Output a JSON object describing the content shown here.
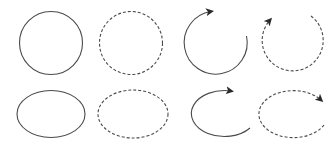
{
  "diagram": {
    "stroke_color": "#4a4a4a",
    "arrow_color": "#2a2a2a",
    "background": "#ffffff",
    "rows": [
      {
        "name": "circles",
        "shapes": [
          {
            "kind": "circle",
            "style": "solid",
            "closed": true
          },
          {
            "kind": "circle",
            "style": "dashed",
            "closed": true
          },
          {
            "kind": "circle-arc",
            "style": "solid",
            "closed": false,
            "arrow": "end",
            "direction": "clockwise"
          },
          {
            "kind": "circle-arc",
            "style": "dashed",
            "closed": false,
            "arrow": "end",
            "direction": "clockwise"
          }
        ]
      },
      {
        "name": "ellipses",
        "shapes": [
          {
            "kind": "ellipse",
            "style": "solid",
            "closed": true
          },
          {
            "kind": "ellipse",
            "style": "dashed",
            "closed": true
          },
          {
            "kind": "ellipse-arc",
            "style": "solid",
            "closed": false,
            "arrow": "end",
            "direction": "clockwise"
          },
          {
            "kind": "ellipse-arc",
            "style": "dashed",
            "closed": false,
            "arrow": "end",
            "direction": "clockwise"
          }
        ]
      }
    ]
  }
}
